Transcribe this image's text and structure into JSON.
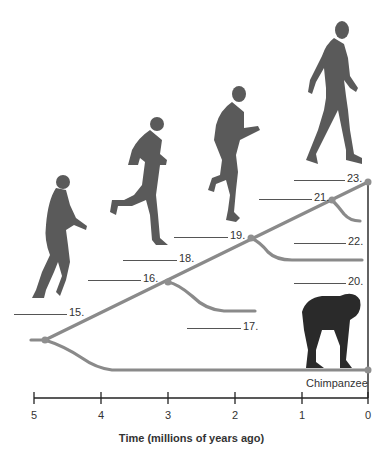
{
  "diagram": {
    "type": "phylogenetic-tree",
    "branch_color": "#8a8a8a",
    "node_color": "#8f8f8f",
    "axis": {
      "title": "Time (millions of years ago)",
      "ticks": [
        "5",
        "4",
        "3",
        "2",
        "1",
        "0"
      ]
    },
    "blanks": [
      {
        "number": "15.",
        "label": "15."
      },
      {
        "number": "16.",
        "label": "16."
      },
      {
        "number": "17.",
        "label": "17."
      },
      {
        "number": "18.",
        "label": "18."
      },
      {
        "number": "19.",
        "label": "19."
      },
      {
        "number": "20.",
        "label": "20."
      },
      {
        "number": "21.",
        "label": "21."
      },
      {
        "number": "22.",
        "label": "22."
      },
      {
        "number": "23.",
        "label": "23."
      }
    ],
    "species": {
      "chimpanzee": "Chimpanzee"
    },
    "figures": [
      {
        "name": "hominid-figure-1",
        "description": "early hominid, stooped walk"
      },
      {
        "name": "hominid-figure-2",
        "description": "hominid running"
      },
      {
        "name": "hominid-figure-3",
        "description": "hominid running upright"
      },
      {
        "name": "hominid-figure-4",
        "description": "modern human walking"
      },
      {
        "name": "chimpanzee-figure",
        "description": "chimpanzee on all fours"
      }
    ]
  }
}
